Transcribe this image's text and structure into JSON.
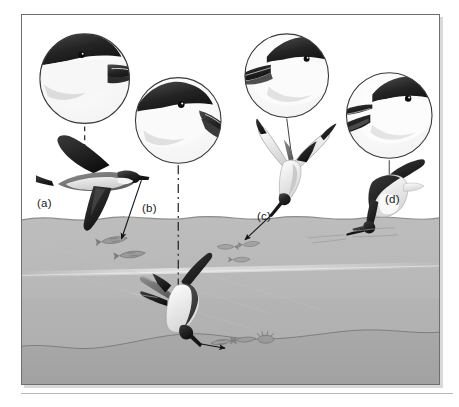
{
  "figure": {
    "caption_labels": [
      {
        "key": "a",
        "text": "(a)",
        "subject": "petrel-in-flight",
        "strategy": "surface-seizing / dipping",
        "bill": "tubenose hooked bill"
      },
      {
        "key": "b",
        "text": "(b)",
        "subject": "shearwater-head",
        "strategy": "pursuit-diving",
        "bill": "long slender hooked bill"
      },
      {
        "key": "c",
        "text": "(c)",
        "subject": "tern-plunge-diving",
        "strategy": "plunge-diving",
        "bill": "sharp pointed bill"
      },
      {
        "key": "d",
        "text": "(d)",
        "subject": "skimmer-skimming",
        "strategy": "skimming",
        "bill": "elongated lower mandible"
      }
    ],
    "background_color": "#ffffff",
    "frame_color": "#6f6f6f",
    "ink_color": "#1a1a1a"
  },
  "scene": {
    "sky": {
      "label": "air above water",
      "color": "#ffffff"
    },
    "water_surface": {
      "label": "water surface",
      "y": 218,
      "color": "#b9b9b9"
    },
    "water_upper": {
      "label": "upper water column",
      "color": "#b4b4b4"
    },
    "water_lower": {
      "label": "lower water column",
      "color": "#b0b0b0"
    },
    "seabed": {
      "label": "seabed",
      "color": "#a8a8a8"
    },
    "light_band": {
      "label": "light shaft band",
      "y": 268
    }
  },
  "magnifier_circles": [
    {
      "key": "a",
      "name": "head-detail-circle-a",
      "cx": 84,
      "cy": 78,
      "r": 46,
      "subject": "petrel head with tubenose bill"
    },
    {
      "key": "b",
      "name": "head-detail-circle-b",
      "cx": 178,
      "cy": 120,
      "r": 44,
      "subject": "shearwater head with slender bill"
    },
    {
      "key": "c",
      "name": "head-detail-circle-c",
      "cx": 287,
      "cy": 75,
      "r": 43,
      "subject": "tern head with dagger bill"
    },
    {
      "key": "d",
      "name": "head-detail-circle-d",
      "cx": 390,
      "cy": 115,
      "r": 44,
      "subject": "skimmer head with long lower mandible"
    }
  ],
  "birds": [
    {
      "key": "a",
      "name": "petrel-in-flight",
      "pose": "gliding above surface"
    },
    {
      "key": "c",
      "name": "tern-plunge-diving",
      "pose": "head-down dive into surface"
    },
    {
      "key": "d",
      "name": "skimmer-skimming",
      "pose": "bill ploughing the surface"
    },
    {
      "key": "b",
      "name": "shearwater-underwater",
      "pose": "wing-propelled pursuit dive"
    }
  ],
  "prey": [
    {
      "name": "fish-school-surface-left",
      "depth": "just below surface",
      "count": 2
    },
    {
      "name": "fish-school-surface-right",
      "depth": "just below surface",
      "count": 3
    },
    {
      "name": "benthic-prey-group",
      "depth": "on the seabed",
      "count": 3
    }
  ],
  "arrows": [
    {
      "name": "foraging-arrow-a",
      "from": "petrel-in-flight",
      "to": "fish-school-surface-left",
      "style": "solid"
    },
    {
      "name": "foraging-arrow-c",
      "from": "tern-plunge-diving",
      "to": "fish-school-surface-right",
      "style": "solid"
    },
    {
      "name": "foraging-arrow-b",
      "from": "shearwater-underwater",
      "to": "benthic-prey-group",
      "style": "solid"
    }
  ],
  "leader_lines": [
    {
      "name": "leader-line-a",
      "style": "dashed",
      "from": "head-detail-circle-a",
      "to": "petrel-in-flight"
    },
    {
      "name": "leader-line-b",
      "style": "dash-dot",
      "from": "head-detail-circle-b",
      "to": "shearwater-underwater"
    },
    {
      "name": "leader-line-c",
      "style": "solid",
      "from": "head-detail-circle-c",
      "to": "tern-plunge-diving"
    },
    {
      "name": "leader-line-d",
      "style": "solid",
      "from": "head-detail-circle-d",
      "to": "skimmer-skimming"
    }
  ]
}
